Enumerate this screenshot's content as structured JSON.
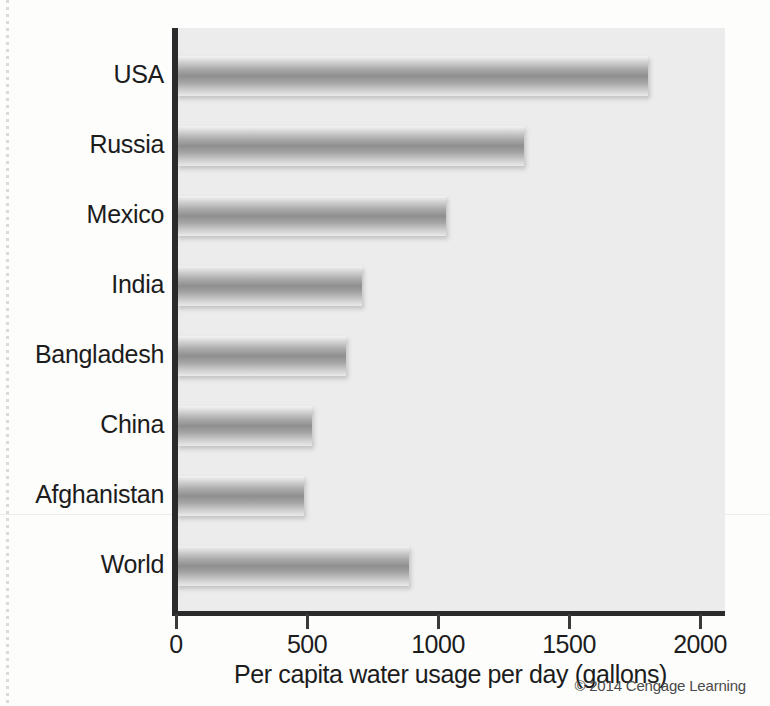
{
  "figure": {
    "credit": "© 2014 Cengage Learning"
  },
  "chart_data": {
    "type": "bar",
    "orientation": "horizontal",
    "title": "",
    "xlabel": "Per capita water usage per day (gallons)",
    "ylabel": "",
    "xlim": [
      0,
      2000
    ],
    "xticks": [
      0,
      500,
      1000,
      1500,
      2000
    ],
    "xtick_labels": [
      "0",
      "500",
      "1000",
      "1500",
      "2000"
    ],
    "grid": false,
    "legend": null,
    "categories": [
      "USA",
      "Russia",
      "Mexico",
      "India",
      "Bangladesh",
      "China",
      "Afghanistan",
      "World"
    ],
    "values": [
      1800,
      1330,
      1030,
      710,
      650,
      520,
      490,
      890
    ],
    "bars": [
      {
        "label": "USA",
        "value": 1800
      },
      {
        "label": "Russia",
        "value": 1330
      },
      {
        "label": "Mexico",
        "value": 1030
      },
      {
        "label": "India",
        "value": 710
      },
      {
        "label": "Bangladesh",
        "value": 650
      },
      {
        "label": "China",
        "value": 520
      },
      {
        "label": "Afghanistan",
        "value": 490
      },
      {
        "label": "World",
        "value": 890
      }
    ]
  },
  "colors": {
    "bar_light": "#f4f4f4",
    "bar_mid": "#8f8f8f",
    "axis": "#2b2b2b",
    "plot_background": "#ececec",
    "page_background": "#fdfdfc"
  }
}
